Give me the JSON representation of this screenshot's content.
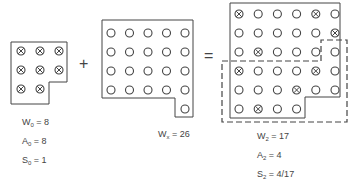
{
  "operators": {
    "plus": "+",
    "equals": "="
  },
  "left_grid": {
    "name": "W0 set",
    "rows": [
      [
        "x",
        "x",
        "x"
      ],
      [
        "x",
        "x",
        "x"
      ],
      [
        "x",
        "x"
      ]
    ],
    "labels": [
      {
        "sym": "W",
        "sub": "0",
        "val": "= 8"
      },
      {
        "sym": "A",
        "sub": "0",
        "val": "= 8"
      },
      {
        "sym": "S",
        "sub": "0",
        "val": "= 1"
      }
    ]
  },
  "middle_grid": {
    "name": "Wx set",
    "rows": [
      [
        "o",
        "o",
        "o",
        "o",
        "o"
      ],
      [
        "o",
        "o",
        "o",
        "o",
        "o"
      ],
      [
        "o",
        "o",
        "o",
        "o",
        "o"
      ],
      [
        "o",
        "o",
        "o",
        "o",
        "o"
      ],
      [
        "",
        "",
        "",
        "",
        "o"
      ]
    ],
    "labels": [
      {
        "sym": "W",
        "sub": "x",
        "val": "= 26"
      }
    ]
  },
  "right_grid": {
    "name": "W2 set",
    "rows": [
      [
        "x",
        "o",
        "o",
        "o",
        "x",
        "o"
      ],
      [
        "o",
        "o",
        "o",
        "o",
        "o",
        "x"
      ],
      [
        "o",
        "x",
        "o",
        "o",
        "o",
        "o"
      ],
      [
        "x",
        "o",
        "o",
        "o",
        "x",
        "o"
      ],
      [
        "o",
        "o",
        "o",
        "x",
        "o",
        "o"
      ],
      [
        "o",
        "x",
        "o",
        "o"
      ]
    ],
    "labels": [
      {
        "sym": "W",
        "sub": "2",
        "val": "= 17"
      },
      {
        "sym": "A",
        "sub": "2",
        "val": "= 4"
      },
      {
        "sym": "S",
        "sub": "2",
        "val": "= 4/17"
      }
    ]
  }
}
